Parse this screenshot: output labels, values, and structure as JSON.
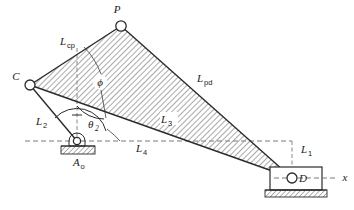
{
  "figure": {
    "type": "kinematic-linkage-diagram"
  },
  "joints": [
    {
      "id": "C",
      "label": "C",
      "x": 30,
      "y": 85,
      "r": 5.0
    },
    {
      "id": "P",
      "label": "P",
      "x": 121,
      "y": 26,
      "r": 5.2
    },
    {
      "id": "D",
      "label": "D",
      "x": 292,
      "y": 178,
      "r": 5.0
    },
    {
      "id": "Ao",
      "label": "A",
      "sub": "o",
      "x": 77,
      "y": 141,
      "r": 3.6
    }
  ],
  "labels": {
    "point_c": "C",
    "point_p": "P",
    "point_d": "D",
    "ground_pivot": "A",
    "ground_pivot_sub": "o",
    "link_cp": "L",
    "link_cp_sub": "cp",
    "link_pd": "L",
    "link_pd_sub": "pd",
    "link_2": "L",
    "link_2_sub": "2",
    "link_3": "L",
    "link_3_sub": "3",
    "link_4": "L",
    "link_4_sub": "4",
    "link_1": "L",
    "link_1_sub": "1",
    "angle_theta": "θ",
    "angle_theta_sub": "2",
    "angle_phi": "ϕ",
    "axis_x": "x"
  },
  "colors": {
    "line": "#2b2b2b",
    "dashed": "#6b6b6b",
    "hatch": "#8c8c8c",
    "background": "#ffffff",
    "joint_fill": "#ffffff"
  },
  "geometry": {
    "coupler_triangle": "30,85 121,26 292,178",
    "crank_c_to_ao": "30,85 77,141",
    "ground_line_y": 141,
    "ground_line_x_start": 25,
    "ground_line_x_end": 292,
    "x_axis_y": 178,
    "x_axis_x_end": 338,
    "vertical_dash_x": 77,
    "vertical_dash_top": 48,
    "vertical_dash_bottom": 141,
    "l1_dash_x": 292,
    "slider_block": {
      "x": 270,
      "y": 167,
      "w": 52,
      "h": 23
    },
    "slider_ground": {
      "x": 265,
      "y": 190,
      "w": 62,
      "h": 7
    },
    "pivot_ground": {
      "x": 61,
      "y": 146,
      "w": 34,
      "h": 8
    }
  }
}
